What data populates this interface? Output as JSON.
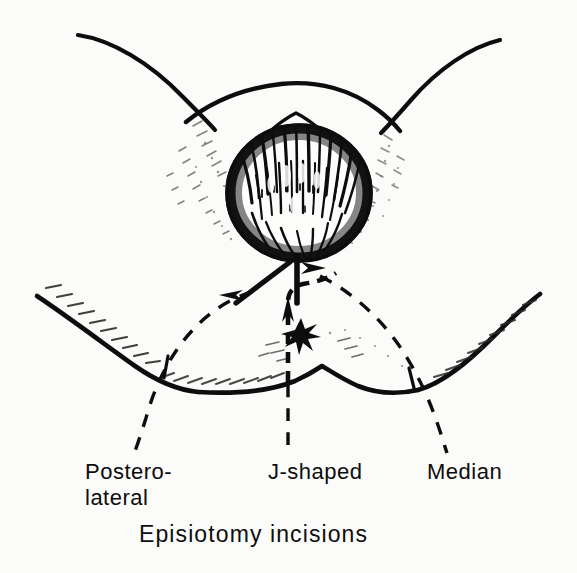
{
  "figure": {
    "title": "Episiotomy incisions",
    "caption": "Episiotomy incisions",
    "background_color": "#fbfbfa",
    "ink_color": "#0d0d0d",
    "width_px": 577,
    "height_px": 573
  },
  "labels": {
    "postero_lateral": {
      "line1": "Postero-",
      "line2": "lateral",
      "full": "Postero-lateral"
    },
    "j_shaped": {
      "full": "J-shaped"
    },
    "median": {
      "full": "Median"
    }
  },
  "anatomy": {
    "fetal_head": "crowning vertex with hair",
    "vulvar_ring": "stretched introitus",
    "perineal_body": "perineum",
    "anus_marker": "star",
    "left_thigh": "left thigh fold",
    "right_thigh": "right thigh fold"
  },
  "incisions": {
    "median": {
      "style": "solid",
      "arrow": "arrowhead",
      "direction": "vertical midline, downward from fourchette"
    },
    "postero_lateral": {
      "style": "solid",
      "arrow": "arrowhead",
      "direction": "oblique downward and laterally to the left"
    },
    "j_shaped": {
      "style": "dashed",
      "arrow": "arrowhead",
      "direction": "midline then curving laterally, J-shaped"
    }
  },
  "leaders": {
    "postero_lateral_leader": "dashed leader line",
    "j_shaped_leader": "dashed leader line",
    "median_leader": "dashed leader line"
  }
}
